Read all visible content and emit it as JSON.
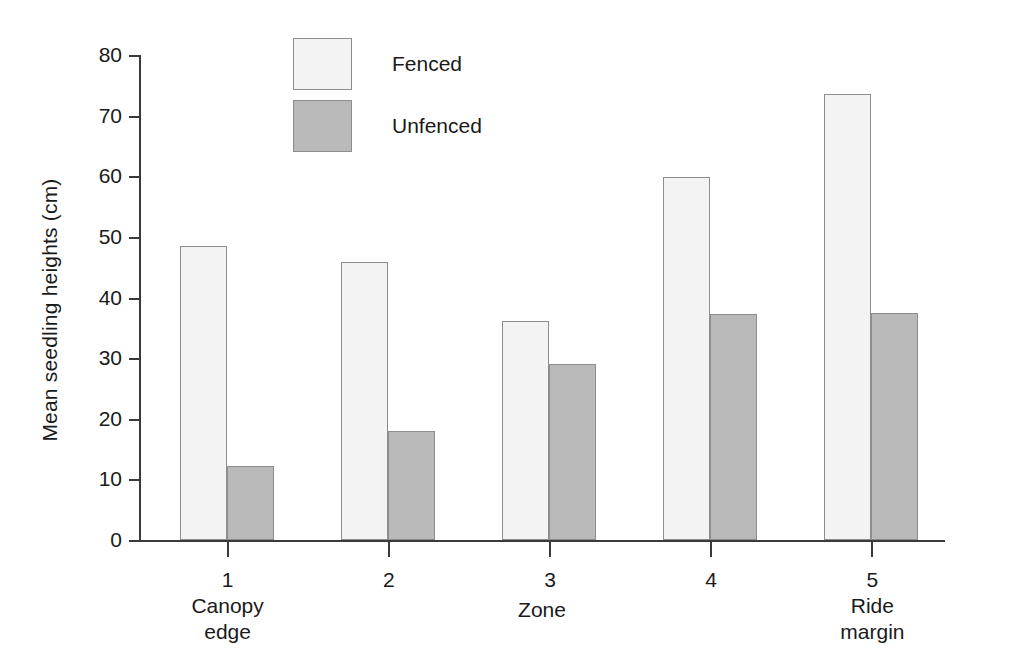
{
  "chart_data": {
    "type": "bar",
    "title": "",
    "xlabel": "Zone",
    "ylabel": "Mean seedling heights (cm)",
    "categories": [
      "1",
      "2",
      "3",
      "4",
      "5"
    ],
    "category_sublabels": [
      "Canopy edge",
      "",
      "",
      "",
      "Ride margin"
    ],
    "category_sublabel_lines": [
      [
        "Canopy",
        "edge"
      ],
      [],
      [],
      [],
      [
        "Ride",
        "margin"
      ]
    ],
    "series": [
      {
        "name": "Fenced",
        "color": "#f3f3f3",
        "values": [
          48.5,
          45.9,
          36.2,
          59.8,
          73.6
        ]
      },
      {
        "name": "Unfenced",
        "color": "#b9b9b9",
        "values": [
          12.2,
          18.0,
          29.0,
          37.3,
          37.4
        ]
      }
    ],
    "ylim": [
      0,
      80
    ],
    "yticks": [
      0,
      10,
      20,
      30,
      40,
      50,
      60,
      70,
      80
    ],
    "ytick_labels": [
      "0",
      "10",
      "20",
      "30",
      "40",
      "50",
      "60",
      "70",
      "80"
    ],
    "grid": false,
    "legend_position": "top-left-inside",
    "legend_entries": [
      "Fenced",
      "Unfenced"
    ],
    "axis_color": "#3a3a3a",
    "bar_edge_color": "#8d8d8d"
  }
}
